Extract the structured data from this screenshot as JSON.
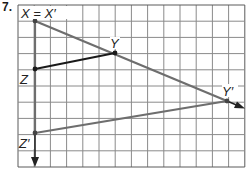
{
  "problem": {
    "number": "7."
  },
  "grid": {
    "x0": 18,
    "y0": 5,
    "cols": 14,
    "rows": 10,
    "cell": 16.2,
    "line_color": "#8a8a8a",
    "border_color": "#5a5a5a"
  },
  "points": {
    "X": {
      "label": "X = X′",
      "x": 35,
      "y": 21
    },
    "Y": {
      "label": "Y",
      "x": 115,
      "y": 53
    },
    "Z": {
      "label": "Z",
      "x": 35,
      "y": 69
    },
    "Y_prime": {
      "label": "Y′",
      "x": 227,
      "y": 101
    },
    "Z_prime": {
      "label": "Z′",
      "x": 35,
      "y": 133
    }
  },
  "colors": {
    "original": "#1a1a1a",
    "image": "#6e6e6e",
    "ray": "#222222"
  },
  "labels": {
    "xx": "X = X′",
    "y": "Y",
    "z": "Z",
    "yp": "Y′",
    "zp": "Z′"
  }
}
